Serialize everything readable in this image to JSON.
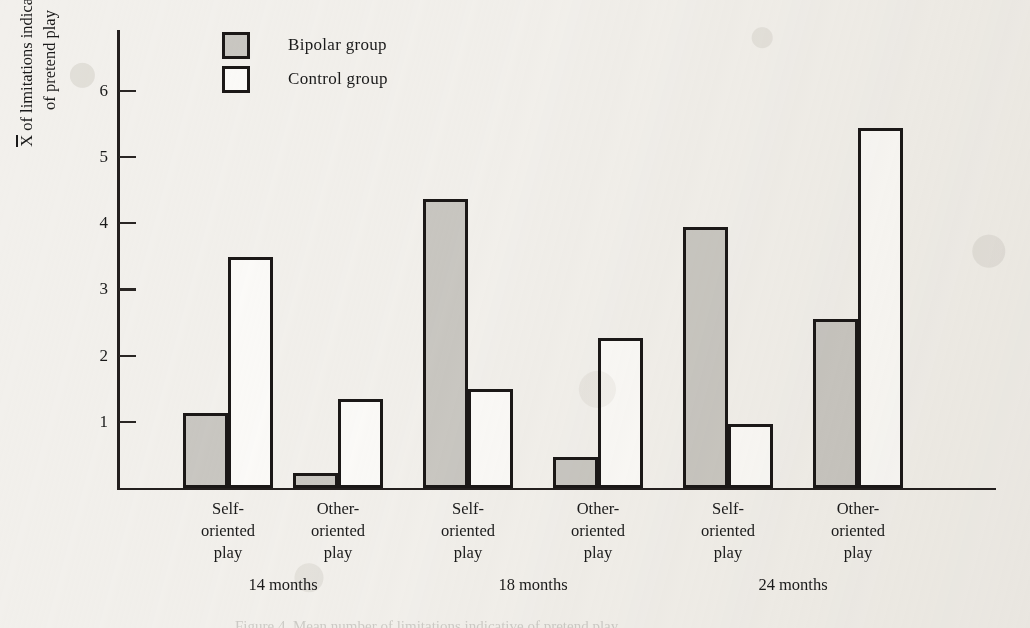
{
  "chart_data": {
    "type": "bar",
    "title": "",
    "subtitle": "",
    "xlabel": "",
    "ylabel_lines": [
      "X of limitations indicative",
      "of pretend play"
    ],
    "ylabel": "X̄ of limitations indicative of pretend play",
    "ylabel_prefix_overbar": "X",
    "ylabel_line1_rest": " of limitations indicative",
    "ylabel_line2": "of pretend play",
    "ylim": [
      0,
      6.6
    ],
    "yticks": [
      1,
      2,
      3,
      4,
      5,
      6
    ],
    "ytick_labels": [
      "1",
      "2",
      "3",
      "4",
      "5",
      "6"
    ],
    "grid": false,
    "legend_position": "top-center-left",
    "categories": [
      "Self-oriented play",
      "Other-oriented play",
      "Self-oriented play",
      "Other-oriented play",
      "Self-oriented play",
      "Other-oriented play"
    ],
    "category_label_lines": [
      [
        "Self-",
        "oriented",
        "play"
      ],
      [
        "Other-",
        "oriented",
        "play"
      ],
      [
        "Self-",
        "oriented",
        "play"
      ],
      [
        "Other-",
        "oriented",
        "play"
      ],
      [
        "Self-",
        "oriented",
        "play"
      ],
      [
        "Other-",
        "oriented",
        "play"
      ]
    ],
    "group_labels": [
      "14 months",
      "18 months",
      "24 months"
    ],
    "series": [
      {
        "name": "Bipolar group",
        "color": "#c9c7c2",
        "edge_color": "#1b1817",
        "values": [
          1.13,
          0.23,
          4.37,
          0.47,
          3.95,
          2.55
        ]
      },
      {
        "name": "Control group",
        "color": "#fbfaf8",
        "edge_color": "#1b1817",
        "values": [
          3.49,
          1.34,
          1.5,
          2.27,
          0.97,
          5.44
        ]
      }
    ]
  },
  "legend": {
    "items": [
      {
        "label": "Bipolar group",
        "style": "bipolar"
      },
      {
        "label": "Control group",
        "style": "control"
      }
    ]
  },
  "colors": {
    "paper": "#f2f0ec",
    "ink": "#1b1817",
    "bipolar_fill": "#c9c7c2",
    "control_fill": "#fbfaf8"
  },
  "caption_sliver": "Figure 4.  Mean number of limitations indicative of pretend play"
}
